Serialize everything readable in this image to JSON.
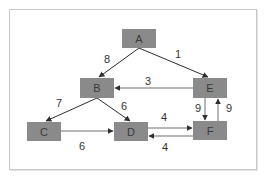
{
  "diagram": {
    "type": "weighted-directed-graph",
    "nodes": [
      {
        "id": "A",
        "label": "A",
        "x": 122,
        "y": 29,
        "w": 34,
        "h": 19
      },
      {
        "id": "B",
        "label": "B",
        "x": 80,
        "y": 78,
        "w": 34,
        "h": 20
      },
      {
        "id": "E",
        "label": "E",
        "x": 193,
        "y": 78,
        "w": 34,
        "h": 20
      },
      {
        "id": "C",
        "label": "C",
        "x": 27,
        "y": 122,
        "w": 34,
        "h": 19
      },
      {
        "id": "D",
        "label": "D",
        "x": 114,
        "y": 122,
        "w": 34,
        "h": 19
      },
      {
        "id": "F",
        "label": "F",
        "x": 193,
        "y": 121,
        "w": 34,
        "h": 19
      }
    ],
    "edges": [
      {
        "from": "A",
        "to": "B",
        "weight": "8"
      },
      {
        "from": "A",
        "to": "E",
        "weight": "1"
      },
      {
        "from": "E",
        "to": "B",
        "weight": "3"
      },
      {
        "from": "B",
        "to": "C",
        "weight": "7"
      },
      {
        "from": "B",
        "to": "D",
        "weight": "6"
      },
      {
        "from": "C",
        "to": "D",
        "weight": "6"
      },
      {
        "from": "D",
        "to": "F",
        "weight": "4"
      },
      {
        "from": "F",
        "to": "D",
        "weight": "4"
      },
      {
        "from": "E",
        "to": "F",
        "weight": "9"
      },
      {
        "from": "F",
        "to": "E",
        "weight": "9"
      }
    ],
    "colors": {
      "node_fill": "#8a8a8a",
      "node_text": "#3a3a3a",
      "edge_dark": "#2e2e2e",
      "edge_light": "#6e6e6e",
      "frame_border": "#c8c8c8",
      "background": "#ffffff"
    }
  }
}
